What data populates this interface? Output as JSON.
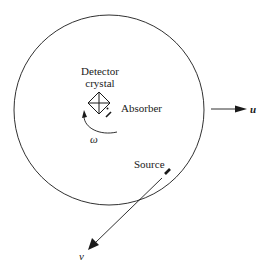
{
  "diagram": {
    "labels": {
      "detector_line1": "Detector",
      "detector_line2": "crystal",
      "absorber": "Absorber",
      "source": "Source",
      "omega": "ω",
      "u_axis": "u",
      "v_axis": "v"
    },
    "colors": {
      "stroke": "#1a1a1a",
      "background": "#ffffff"
    },
    "shapes": {
      "circle": {
        "cx": 109,
        "cy": 110,
        "r": 95
      },
      "u_arrow": {
        "x1": 211,
        "y1": 109,
        "x2": 247,
        "y2": 109
      },
      "v_arrow": {
        "x1": 162,
        "y1": 178,
        "x2": 88,
        "y2": 250
      }
    }
  }
}
